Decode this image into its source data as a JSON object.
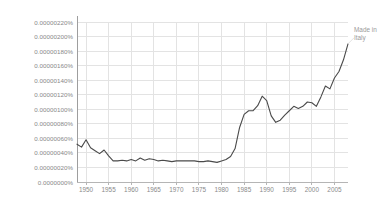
{
  "chart_data": {
    "type": "line",
    "title": "",
    "xlabel": "",
    "ylabel": "",
    "xlim": [
      1948,
      2008
    ],
    "ylim": [
      0,
      2.2e-06
    ],
    "grid": true,
    "legend_position": "right",
    "legend_entries": [
      "Made in Italy"
    ],
    "legend_label_lines": [
      "Made in",
      "Italy"
    ],
    "line_color": "#4a4a4a",
    "grid_color": "#e3e3e3",
    "axis_color": "#b5b5b5",
    "tick_label_color": "#8a8a8a",
    "y_tick_labels": [
      "0.00000220%",
      "0.00000200%",
      "0.00000180%",
      "0.00000160%",
      "0.00000140%",
      "0.00000120%",
      "0.00000100%",
      "0.00000080%",
      "0.00000060%",
      "0.00000040%",
      "0.00000020%",
      "0.0000000%"
    ],
    "y_tick_values": [
      2.2e-06,
      2e-06,
      1.8e-06,
      1.6e-06,
      1.4e-06,
      1.2e-06,
      1e-06,
      8e-07,
      6e-07,
      4e-07,
      2e-07,
      0.0
    ],
    "x_tick_labels": [
      "1950",
      "1955",
      "1960",
      "1965",
      "1970",
      "1975",
      "1980",
      "1985",
      "1990",
      "1995",
      "2000",
      "2005"
    ],
    "x_tick_values": [
      1950,
      1955,
      1960,
      1965,
      1970,
      1975,
      1980,
      1985,
      1990,
      1995,
      2000,
      2005
    ],
    "series": [
      {
        "name": "Made in Italy",
        "x": [
          1948,
          1949,
          1950,
          1951,
          1952,
          1953,
          1954,
          1955,
          1956,
          1957,
          1958,
          1959,
          1960,
          1961,
          1962,
          1963,
          1964,
          1965,
          1966,
          1967,
          1968,
          1969,
          1970,
          1971,
          1972,
          1973,
          1974,
          1975,
          1976,
          1977,
          1978,
          1979,
          1980,
          1981,
          1982,
          1983,
          1984,
          1985,
          1986,
          1987,
          1988,
          1989,
          1990,
          1991,
          1992,
          1993,
          1994,
          1995,
          1996,
          1997,
          1998,
          1999,
          2000,
          2001,
          2002,
          2003,
          2004,
          2005,
          2006,
          2007,
          2008
        ],
        "values": [
          5.2e-07,
          4.8e-07,
          5.8e-07,
          4.7e-07,
          4.3e-07,
          3.9e-07,
          4.4e-07,
          3.6e-07,
          2.9e-07,
          2.9e-07,
          3e-07,
          2.9e-07,
          3.1e-07,
          2.9e-07,
          3.3e-07,
          3e-07,
          3.2e-07,
          3.1e-07,
          2.9e-07,
          3e-07,
          2.9e-07,
          2.8e-07,
          2.9e-07,
          2.9e-07,
          2.9e-07,
          2.9e-07,
          2.9e-07,
          2.8e-07,
          2.8e-07,
          2.9e-07,
          2.8e-07,
          2.7e-07,
          2.9e-07,
          3.1e-07,
          3.5e-07,
          4.6e-07,
          7.5e-07,
          9.3e-07,
          9.8e-07,
          9.8e-07,
          1.05e-06,
          1.18e-06,
          1.12e-06,
          9.1e-07,
          8.2e-07,
          8.5e-07,
          9.2e-07,
          9.8e-07,
          1.04e-06,
          1.01e-06,
          1.04e-06,
          1.1e-06,
          1.09e-06,
          1.04e-06,
          1.17e-06,
          1.32e-06,
          1.28e-06,
          1.43e-06,
          1.52e-06,
          1.68e-06,
          1.9e-06
        ]
      }
    ]
  }
}
